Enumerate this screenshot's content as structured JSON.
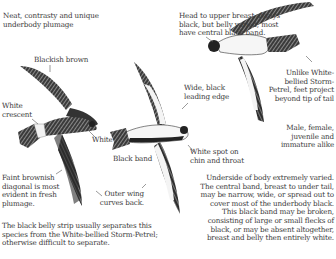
{
  "plate": {
    "notes": {
      "underbody": "Neat, contrasty and unique\nunderbody plumage",
      "blackish_brown": "Blackish brown",
      "white_crescent": "White\ncrescent",
      "white": "White",
      "faint_diagonal": "Faint brownish\ndiagonal is most\nevident in fresh\nplumage.",
      "outer_wing": "Outer wing\ncurves back.",
      "black_band": "Black band",
      "wide_black_edge": "Wide, black\nleading edge",
      "white_spot": "White spot on\nchin and throat",
      "head_breast": "Head to upper breast always\nblack, but belly varied; most\nhave central black band.",
      "feet_project": "Unlike White-\nbellied Storm-\nPetrel, feet project\nbeyond tip of tail",
      "sexes_alike": "Male, female,\njuvenile and\nimmature alike",
      "body_varied": "Underside of body extremely varied.\nThe central band, breast to under tail,\nmay be narrow, wide, or spread out to\ncover most of the underbody black.\nThis black band may be broken,\nconsisting of large or small flecks of\nblack, or may be absent altogether,\nbreast and belly then entirely white.",
      "separation": "The black belly strip usually separates this\nspecies from the White-bellied Storm-Petrel;\notherwise difficult to separate."
    },
    "figures": [
      {
        "name": "upperside-bird",
        "view": "dorsal"
      },
      {
        "name": "underside-bird",
        "view": "ventral"
      },
      {
        "name": "banking-bird",
        "view": "ventral, banking"
      }
    ],
    "colors": {
      "ink": "#3a3a3a",
      "plumage_dark": "#2b2b2b",
      "plumage_light": "#f4f4f4",
      "leader_line": "#555555"
    }
  }
}
